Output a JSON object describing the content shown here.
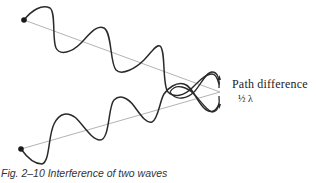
{
  "figure": {
    "label_path_difference": "Path difference",
    "label_fraction": "½ λ",
    "caption": "Fig. 2–10  Interference of two waves",
    "elements": {
      "upper_wave": "wave from upper source",
      "lower_wave": "wave from lower source",
      "upper_ray": "straight path line from upper source",
      "lower_ray": "straight path line from lower source"
    },
    "colors": {
      "wave": "#2a2a2a",
      "ray": "#9a9a9a",
      "text": "#222222"
    }
  }
}
